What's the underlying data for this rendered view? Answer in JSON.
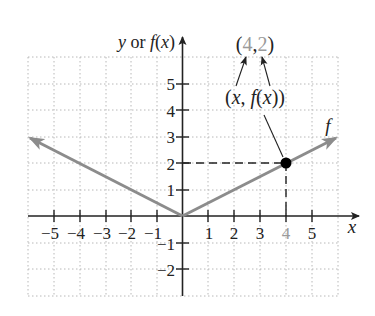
{
  "chart_data": {
    "type": "line",
    "title": "",
    "xlabel": "x",
    "ylabel": "y or f(x)",
    "xlim": [
      -6,
      6
    ],
    "ylim": [
      -3,
      6
    ],
    "grid": true,
    "x_ticks": [
      -5,
      -4,
      -3,
      -2,
      -1,
      1,
      2,
      3,
      4,
      5
    ],
    "y_ticks": [
      -2,
      -1,
      1,
      2,
      3,
      4,
      5
    ],
    "x_tick_labels": [
      "−5",
      "−4",
      "−3",
      "−2",
      "−1",
      "1",
      "2",
      "3",
      "4",
      "5"
    ],
    "y_tick_labels": [
      "−2",
      "−1",
      "1",
      "2",
      "3",
      "4",
      "5"
    ],
    "series": [
      {
        "name": "f",
        "function": "f(x) = |x|/2",
        "x": [
          -6,
          0,
          6
        ],
        "y": [
          3,
          0,
          3
        ],
        "color": "#8c8c8c"
      }
    ],
    "highlighted_point": {
      "x": 4,
      "y": 2
    },
    "annotations": [
      {
        "text": "(4, 2)",
        "target": "point label"
      },
      {
        "text": "(x, f(x))",
        "target": "point (4,2)"
      },
      {
        "text": "f",
        "target": "curve label"
      }
    ]
  },
  "labels": {
    "y_axis": "y or f(x)",
    "x_axis": "x",
    "curve": "f",
    "point_open": "(",
    "point_x": "4",
    "point_comma": ",",
    "point_y": "2",
    "point_close": ")",
    "generic_open": "(",
    "generic_x": "x",
    "generic_sep": ", ",
    "generic_f": "f",
    "generic_paren": "(",
    "generic_x2": "x",
    "generic_close": "))"
  },
  "ticks": {
    "x": [
      "−5",
      "−4",
      "−3",
      "−2",
      "−1",
      "1",
      "2",
      "3",
      "4",
      "5"
    ],
    "y": [
      "5",
      "4",
      "3",
      "2",
      "1",
      "−1",
      "−2"
    ]
  },
  "colors": {
    "axis": "#222222",
    "grid": "#b8b8b8",
    "curve": "#8c8c8c",
    "highlight": "#9a9a9a",
    "point": "#000000"
  }
}
